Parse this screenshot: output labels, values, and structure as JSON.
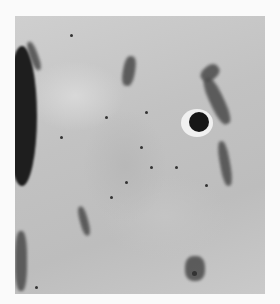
{
  "image": {
    "subject": "lunar surface photograph",
    "description": "Grayscale overhead view of a cratered lunar highland region with a prominent small bright-rimmed crater at upper right and a large dark crater wall shadow at the left edge",
    "features": [
      {
        "name": "bright-rimmed-crater",
        "x": 197,
        "y": 124
      },
      {
        "name": "left-crater-wall-shadow",
        "x": 22,
        "y": 110
      },
      {
        "name": "upper-right-ridge-shadows",
        "x": 215,
        "y": 80
      }
    ],
    "colors": {
      "background": "#fafafa",
      "terrain": "#c4c4c4",
      "shadow": "#1e1e1e",
      "highlight": "#f0f0f0"
    }
  }
}
